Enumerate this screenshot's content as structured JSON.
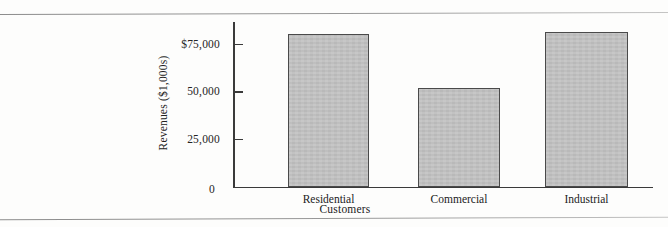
{
  "figure": {
    "background_color": "#fdfdfc",
    "rule_color": "#787878"
  },
  "chart_data": {
    "type": "bar",
    "title": "",
    "categories": [
      "Residential",
      "Commercial",
      "Industrial"
    ],
    "values": [
      80000,
      52000,
      81500
    ],
    "xlabel": "Customers",
    "ylabel": "Revenues ($1,000s)",
    "ylim": [
      0,
      87000
    ],
    "ytick_values": [
      0,
      25000,
      50000,
      75000
    ],
    "ytick_labels": [
      "0",
      "25,000",
      "50,000",
      "$75,000"
    ],
    "grid": false,
    "legend": null,
    "bar_fill_color": "#bdbdbd",
    "bar_edge_color": "#4a4a4a",
    "axis_color": "#3a3a3a"
  }
}
